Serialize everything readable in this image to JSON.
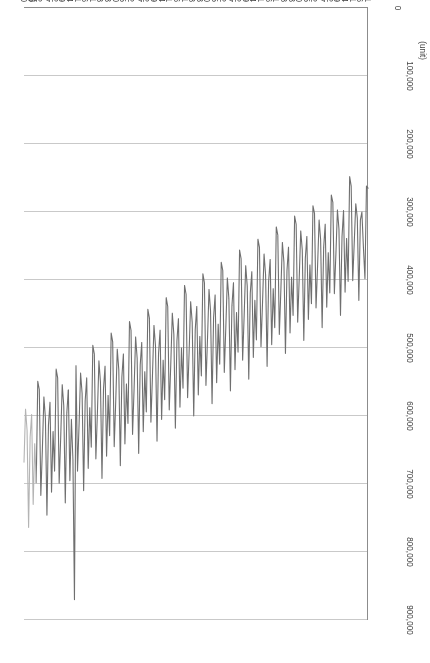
{
  "chart_data": {
    "type": "line",
    "title": "",
    "xlabel": "(year_month)",
    "ylabel": "(unit)",
    "ylim": [
      0,
      900000
    ],
    "grid": true,
    "legend_position": "bottom",
    "y_tick_labels": [
      "900,000",
      "800,000",
      "700,000",
      "600,000",
      "500,000",
      "400,000",
      "300,000",
      "200,000",
      "100,000",
      "0"
    ],
    "y_tick_values": [
      900000,
      800000,
      700000,
      600000,
      500000,
      400000,
      300000,
      200000,
      100000,
      0
    ],
    "x_tick_labels": [
      "1993_01",
      "6",
      "11",
      "4",
      "9",
      "2",
      "7",
      "12",
      "5",
      "10",
      "3",
      "8",
      "1998_01",
      "6",
      "11",
      "4",
      "9",
      "2",
      "7",
      "12",
      "5",
      "10",
      "3",
      "8",
      "2003_01",
      "6",
      "11",
      "4",
      "9",
      "2",
      "7",
      "12",
      "5",
      "10",
      "3",
      "8",
      "2008_01",
      "6",
      "11",
      "4",
      "9",
      "2",
      "7",
      "12",
      "5",
      "10"
    ],
    "series": [
      {
        "name": "Unit Sales (1993_01_2009_05)",
        "color": "#6f6f6f",
        "start_index": 0,
        "values": [
          265000,
          262000,
          398000,
          352000,
          300000,
          312000,
          430000,
          309000,
          288000,
          345000,
          401000,
          262000,
          248000,
          402000,
          339000,
          418000,
          298000,
          336000,
          452000,
          325000,
          297000,
          362000,
          420000,
          286000,
          275000,
          419000,
          360000,
          440000,
          318000,
          352000,
          470000,
          340000,
          312000,
          380000,
          441000,
          302000,
          291000,
          435000,
          378000,
          458000,
          336000,
          368000,
          489000,
          356000,
          328000,
          398000,
          462000,
          318000,
          306000,
          452000,
          396000,
          478000,
          352000,
          386000,
          508000,
          374000,
          345000,
          415000,
          480000,
          334000,
          322000,
          470000,
          413000,
          495000,
          370000,
          402000,
          527000,
          392000,
          362000,
          434000,
          498000,
          352000,
          340000,
          488000,
          430000,
          514000,
          388000,
          419000,
          546000,
          409000,
          379000,
          452000,
          518000,
          369000,
          356000,
          506000,
          448000,
          532000,
          404000,
          438000,
          563000,
          427000,
          397000,
          470000,
          536000,
          386000,
          374000,
          524000,
          465000,
          551000,
          422000,
          455000,
          582000,
          445000,
          414000,
          488000,
          555000,
          404000,
          391000,
          541000,
          483000,
          569000,
          439000,
          473000,
          600000,
          462000,
          432000,
          506000,
          573000,
          421000,
          408000,
          559000,
          500000,
          587000,
          457000,
          490000,
          618000,
          480000,
          449000,
          524000,
          591000,
          439000,
          426000,
          576000,
          518000,
          605000,
          474000,
          508000,
          637000,
          497000,
          467000,
          542000,
          609000,
          456000,
          443000,
          594000,
          535000,
          623000,
          492000,
          525000,
          655000,
          515000,
          484000,
          560000,
          627000,
          474000,
          461000,
          611000,
          553000,
          641000,
          509000,
          543000,
          673000,
          532000,
          502000,
          578000,
          645000,
          491000,
          478000,
          629000,
          570000,
          659000,
          527000,
          560000,
          692000,
          550000,
          519000,
          596000,
          663000,
          509000,
          496000,
          646000,
          588000,
          677000,
          544000,
          578000,
          710000,
          567000,
          537000,
          614000,
          681000,
          526000,
          870000,
          664000,
          605000,
          695000,
          562000
        ]
      },
      {
        "name": "Unit Sales (2009_06_2011_03)",
        "color": "#6f6f6f",
        "start_index": 196,
        "values": [
          562000,
          595000,
          728000,
          585000,
          554000,
          632000,
          699000,
          544000,
          531000,
          681000,
          623000,
          712000,
          580000,
          613000,
          746000,
          603000,
          572000,
          650000,
          717000,
          561000,
          549000,
          698000
        ]
      },
      {
        "name": "Unit Sales (2011_04_2011_12)",
        "color": "#b4b4b4",
        "start_index": 217,
        "values": [
          698000,
          641000,
          730000,
          598000,
          631000,
          764000,
          621000,
          590000,
          668000
        ]
      }
    ]
  },
  "legend": {
    "items": [
      {
        "label": "Unit Sales (1993_01_2009_05)"
      },
      {
        "label": "Unit Sales (2009_06_2011_03)"
      },
      {
        "label": "Unit Sales (2011_04_2011_12)"
      }
    ]
  },
  "axes": {
    "value_axis_title": "(unit)",
    "category_axis_title": "(year_month)"
  }
}
